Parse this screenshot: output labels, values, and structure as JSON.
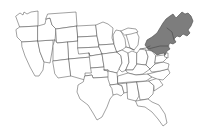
{
  "figure": {
    "kind": "choropleth-region-map",
    "width": 210,
    "height": 139,
    "background_color": "#ffffff"
  },
  "map": {
    "name": "united-states-map",
    "projection_look": "contiguous-48-states",
    "border_color": "#555555",
    "state_fill_color": "#ffffff",
    "outline_color": "#4f4f4f"
  },
  "highlight": {
    "name": "northeast-region",
    "label": "Northeast",
    "fill_color": "#7d7d7d",
    "stroke_color": "#4a4a4a",
    "states": [
      "Maine",
      "New Hampshire",
      "Vermont",
      "Massachusetts",
      "Rhode Island",
      "Connecticut",
      "New York",
      "New Jersey",
      "Pennsylvania"
    ]
  },
  "states": [
    {
      "code": "WA",
      "name": "Washington",
      "highlighted": false
    },
    {
      "code": "OR",
      "name": "Oregon",
      "highlighted": false
    },
    {
      "code": "CA",
      "name": "California",
      "highlighted": false
    },
    {
      "code": "NV",
      "name": "Nevada",
      "highlighted": false
    },
    {
      "code": "ID",
      "name": "Idaho",
      "highlighted": false
    },
    {
      "code": "MT",
      "name": "Montana",
      "highlighted": false
    },
    {
      "code": "WY",
      "name": "Wyoming",
      "highlighted": false
    },
    {
      "code": "UT",
      "name": "Utah",
      "highlighted": false
    },
    {
      "code": "AZ",
      "name": "Arizona",
      "highlighted": false
    },
    {
      "code": "CO",
      "name": "Colorado",
      "highlighted": false
    },
    {
      "code": "NM",
      "name": "New Mexico",
      "highlighted": false
    },
    {
      "code": "ND",
      "name": "North Dakota",
      "highlighted": false
    },
    {
      "code": "SD",
      "name": "South Dakota",
      "highlighted": false
    },
    {
      "code": "NE",
      "name": "Nebraska",
      "highlighted": false
    },
    {
      "code": "KS",
      "name": "Kansas",
      "highlighted": false
    },
    {
      "code": "OK",
      "name": "Oklahoma",
      "highlighted": false
    },
    {
      "code": "TX",
      "name": "Texas",
      "highlighted": false
    },
    {
      "code": "MN",
      "name": "Minnesota",
      "highlighted": false
    },
    {
      "code": "IA",
      "name": "Iowa",
      "highlighted": false
    },
    {
      "code": "MO",
      "name": "Missouri",
      "highlighted": false
    },
    {
      "code": "AR",
      "name": "Arkansas",
      "highlighted": false
    },
    {
      "code": "LA",
      "name": "Louisiana",
      "highlighted": false
    },
    {
      "code": "WI",
      "name": "Wisconsin",
      "highlighted": false
    },
    {
      "code": "IL",
      "name": "Illinois",
      "highlighted": false
    },
    {
      "code": "MS",
      "name": "Mississippi",
      "highlighted": false
    },
    {
      "code": "MI",
      "name": "Michigan",
      "highlighted": false
    },
    {
      "code": "IN",
      "name": "Indiana",
      "highlighted": false
    },
    {
      "code": "OH",
      "name": "Ohio",
      "highlighted": false
    },
    {
      "code": "KY",
      "name": "Kentucky",
      "highlighted": false
    },
    {
      "code": "TN",
      "name": "Tennessee",
      "highlighted": false
    },
    {
      "code": "AL",
      "name": "Alabama",
      "highlighted": false
    },
    {
      "code": "GA",
      "name": "Georgia",
      "highlighted": false
    },
    {
      "code": "FL",
      "name": "Florida",
      "highlighted": false
    },
    {
      "code": "SC",
      "name": "South Carolina",
      "highlighted": false
    },
    {
      "code": "NC",
      "name": "North Carolina",
      "highlighted": false
    },
    {
      "code": "VA",
      "name": "Virginia",
      "highlighted": false
    },
    {
      "code": "WV",
      "name": "West Virginia",
      "highlighted": false
    },
    {
      "code": "MD",
      "name": "Maryland",
      "highlighted": false
    },
    {
      "code": "DE",
      "name": "Delaware",
      "highlighted": false
    },
    {
      "code": "PA",
      "name": "Pennsylvania",
      "highlighted": true
    },
    {
      "code": "NJ",
      "name": "New Jersey",
      "highlighted": true
    },
    {
      "code": "NY",
      "name": "New York",
      "highlighted": true
    },
    {
      "code": "CT",
      "name": "Connecticut",
      "highlighted": true
    },
    {
      "code": "RI",
      "name": "Rhode Island",
      "highlighted": true
    },
    {
      "code": "MA",
      "name": "Massachusetts",
      "highlighted": true
    },
    {
      "code": "VT",
      "name": "Vermont",
      "highlighted": true
    },
    {
      "code": "NH",
      "name": "New Hampshire",
      "highlighted": true
    },
    {
      "code": "ME",
      "name": "Maine",
      "highlighted": true
    }
  ]
}
